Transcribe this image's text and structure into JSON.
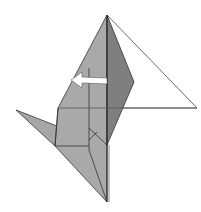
{
  "diagram": {
    "type": "origami-fold-step",
    "colors": {
      "background": "#ffffff",
      "paper_light": "#a9a9a9",
      "paper_mid": "#9a9a9a",
      "paper_dark": "#7e7e7e",
      "line": "#333333",
      "arrow_fill": "#ffffff"
    },
    "arrow": {
      "direction": "left",
      "meaning": "fold flap to the left"
    }
  }
}
